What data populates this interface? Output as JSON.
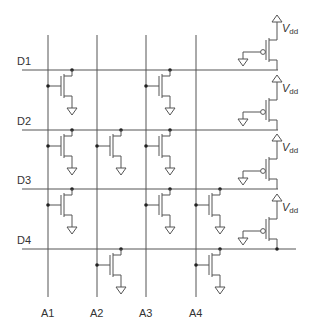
{
  "diagram": {
    "title": "",
    "type": "NOR ROM array with PMOS pull-ups",
    "colors": {
      "wire": "#555555",
      "dot": "#222222",
      "label": "#333333",
      "background": "#ffffff"
    },
    "address_lines": [
      {
        "label": "A1",
        "x": 48
      },
      {
        "label": "A2",
        "x": 97
      },
      {
        "label": "A3",
        "x": 146
      },
      {
        "label": "A4",
        "x": 196
      }
    ],
    "data_lines": [
      {
        "label": "D1",
        "y": 70,
        "x_end": 278
      },
      {
        "label": "D2",
        "y": 130,
        "x_end": 278
      },
      {
        "label": "D3",
        "y": 189,
        "x_end": 278
      },
      {
        "label": "D4",
        "y": 249,
        "x_end": 296
      }
    ],
    "transistors": [
      {
        "row": "D1",
        "col": "A1"
      },
      {
        "row": "D1",
        "col": "A3"
      },
      {
        "row": "D2",
        "col": "A1"
      },
      {
        "row": "D2",
        "col": "A2"
      },
      {
        "row": "D2",
        "col": "A3"
      },
      {
        "row": "D3",
        "col": "A1"
      },
      {
        "row": "D3",
        "col": "A3"
      },
      {
        "row": "D3",
        "col": "A4"
      },
      {
        "row": "D4",
        "col": "A2"
      },
      {
        "row": "D4",
        "col": "A4"
      }
    ],
    "pullups": [
      {
        "row": "D1",
        "supply_main": "V",
        "supply_sub": "dd"
      },
      {
        "row": "D2",
        "supply_main": "V",
        "supply_sub": "dd"
      },
      {
        "row": "D3",
        "supply_main": "V",
        "supply_sub": "dd"
      },
      {
        "row": "D4",
        "supply_main": "V",
        "supply_sub": "dd"
      }
    ]
  }
}
